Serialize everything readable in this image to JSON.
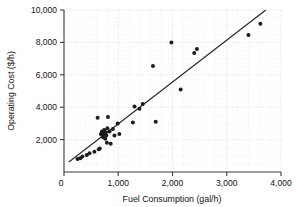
{
  "chart_data": {
    "type": "scatter",
    "title": "",
    "xlabel": "Fuel Consumption (gal/h)",
    "ylabel": "Operating Cost ($/h)",
    "xlim": [
      0,
      4000
    ],
    "ylim": [
      0,
      10000
    ],
    "xticks": [
      0,
      1000,
      2000,
      3000,
      4000
    ],
    "xtick_labels": [
      "0",
      "1,000",
      "2,000",
      "3,000",
      "4,000"
    ],
    "yticks": [
      0,
      2000,
      4000,
      6000,
      8000,
      10000
    ],
    "ytick_labels": [
      "0",
      "2,000",
      "4,000",
      "6,000",
      "8,000",
      "10,000"
    ],
    "grid": true,
    "grid_color": "#c9c9c9",
    "legend": null,
    "marker_color": "#1c1c1c",
    "line_color": "#262626",
    "series": [
      {
        "name": "Aircraft",
        "type": "scatter",
        "points": [
          [
            250,
            800
          ],
          [
            300,
            850
          ],
          [
            340,
            950
          ],
          [
            420,
            1050
          ],
          [
            470,
            1150
          ],
          [
            560,
            1250
          ],
          [
            620,
            3350
          ],
          [
            640,
            1400
          ],
          [
            660,
            1450
          ],
          [
            680,
            2350
          ],
          [
            700,
            2500
          ],
          [
            710,
            2250
          ],
          [
            720,
            2150
          ],
          [
            730,
            2400
          ],
          [
            740,
            2600
          ],
          [
            750,
            2300
          ],
          [
            760,
            2050
          ],
          [
            770,
            2450
          ],
          [
            780,
            2250
          ],
          [
            790,
            1800
          ],
          [
            800,
            2700
          ],
          [
            810,
            3400
          ],
          [
            840,
            2500
          ],
          [
            860,
            1750
          ],
          [
            900,
            2650
          ],
          [
            930,
            2250
          ],
          [
            990,
            3000
          ],
          [
            1020,
            2350
          ],
          [
            1270,
            3050
          ],
          [
            1300,
            4050
          ],
          [
            1390,
            3900
          ],
          [
            1450,
            4200
          ],
          [
            1640,
            6550
          ],
          [
            1690,
            3100
          ],
          [
            1980,
            8000
          ],
          [
            2150,
            5100
          ],
          [
            2400,
            7350
          ],
          [
            2450,
            7600
          ],
          [
            3400,
            8450
          ],
          [
            3620,
            9150
          ]
        ]
      },
      {
        "name": "Linear fit",
        "type": "line",
        "points": [
          [
            90,
            620
          ],
          [
            3720,
            10000
          ]
        ]
      }
    ]
  },
  "axes": {
    "y_title": "Operating Cost ($/h)",
    "x_title": "Fuel Consumption (gal/h)"
  }
}
